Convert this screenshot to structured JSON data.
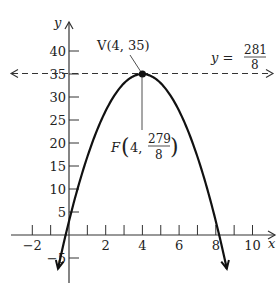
{
  "chart_data": {
    "type": "line",
    "title": "",
    "xlabel": "x",
    "ylabel": "y",
    "xlim": [
      -2.9,
      11.2
    ],
    "ylim": [
      -10.5,
      46.5
    ],
    "grid": false,
    "x_ticks": [
      -2,
      -1,
      0,
      1,
      2,
      3,
      4,
      5,
      6,
      7,
      8,
      9,
      10
    ],
    "x_tick_labels": [
      {
        "value": -2,
        "label": "−2"
      },
      {
        "value": 2,
        "label": "2"
      },
      {
        "value": 4,
        "label": "4"
      },
      {
        "value": 6,
        "label": "6"
      },
      {
        "value": 8,
        "label": "8"
      },
      {
        "value": 10,
        "label": "10"
      }
    ],
    "y_ticks": [
      -5,
      5,
      10,
      15,
      20,
      25,
      30,
      35,
      40
    ],
    "y_tick_labels": [
      {
        "value": -5,
        "label": "−5"
      },
      {
        "value": 5,
        "label": "5"
      },
      {
        "value": 10,
        "label": "10"
      },
      {
        "value": 15,
        "label": "15"
      },
      {
        "value": 20,
        "label": "20"
      },
      {
        "value": 25,
        "label": "25"
      },
      {
        "value": 30,
        "label": "30"
      },
      {
        "value": 35,
        "label": "35"
      },
      {
        "value": 40,
        "label": "40"
      }
    ],
    "series": [
      {
        "name": "parabola",
        "equation": "y = -2x^2 + 16x + 3",
        "coefficients": {
          "a": -2,
          "b": 16,
          "c": 3
        },
        "x_range": [
          -0.6,
          8.6
        ],
        "style": "solid",
        "arrows_at_ends": true
      },
      {
        "name": "directrix",
        "equation": "y = 281/8",
        "value": 35.125,
        "style": "dashed",
        "arrows_at_ends": true
      }
    ],
    "points": [
      {
        "name": "vertex",
        "x": 4,
        "y": 35,
        "label": "V(4, 35)"
      },
      {
        "name": "focus",
        "x": 4,
        "y": 34.875
      }
    ],
    "annotations": {
      "vertex_label": "V(4, 35)",
      "focus_prefix": "F",
      "focus_x": "4,",
      "focus_num": "279",
      "focus_den": "8",
      "directrix_prefix": "y =",
      "directrix_num": "281",
      "directrix_den": "8"
    }
  }
}
